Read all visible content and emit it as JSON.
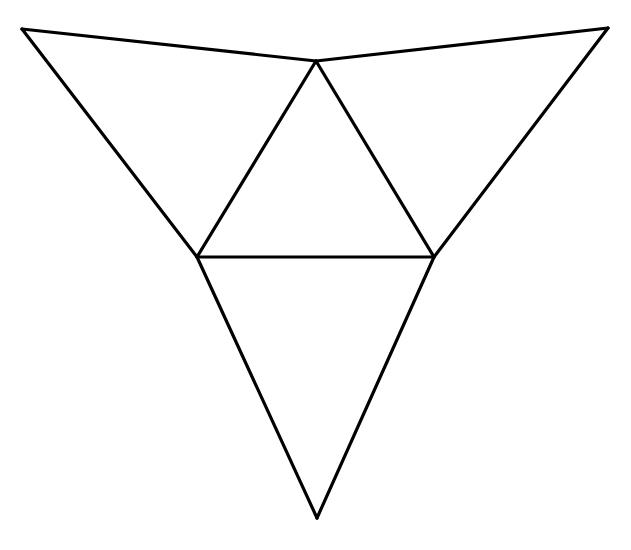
{
  "diagram": {
    "type": "tetrahedron-net",
    "width": 631,
    "height": 550,
    "background": "#ffffff",
    "stroke_color": "#000000",
    "stroke_width": 3.2,
    "vertices": {
      "top_left": [
        22,
        29
      ],
      "top_right": [
        608,
        28
      ],
      "apex": [
        316,
        61
      ],
      "left_mid": [
        197,
        257
      ],
      "right_mid": [
        434,
        257
      ],
      "bottom": [
        317,
        518
      ]
    },
    "edges": [
      {
        "name": "edge-top-left-to-apex",
        "from": "top_left",
        "to": "apex"
      },
      {
        "name": "edge-apex-to-top-right",
        "from": "apex",
        "to": "top_right"
      },
      {
        "name": "edge-top-left-to-left-mid",
        "from": "top_left",
        "to": "left_mid"
      },
      {
        "name": "edge-top-right-to-right-mid",
        "from": "top_right",
        "to": "right_mid"
      },
      {
        "name": "edge-apex-to-left-mid",
        "from": "apex",
        "to": "left_mid"
      },
      {
        "name": "edge-apex-to-right-mid",
        "from": "apex",
        "to": "right_mid"
      },
      {
        "name": "edge-left-mid-to-right-mid",
        "from": "left_mid",
        "to": "right_mid"
      },
      {
        "name": "edge-left-mid-to-bottom",
        "from": "left_mid",
        "to": "bottom"
      },
      {
        "name": "edge-right-mid-to-bottom",
        "from": "right_mid",
        "to": "bottom"
      }
    ],
    "faces": [
      {
        "name": "face-left",
        "points": [
          "top_left",
          "apex",
          "left_mid"
        ]
      },
      {
        "name": "face-right",
        "points": [
          "apex",
          "top_right",
          "right_mid"
        ]
      },
      {
        "name": "face-center",
        "points": [
          "apex",
          "right_mid",
          "left_mid"
        ]
      },
      {
        "name": "face-bottom",
        "points": [
          "left_mid",
          "right_mid",
          "bottom"
        ]
      }
    ]
  }
}
